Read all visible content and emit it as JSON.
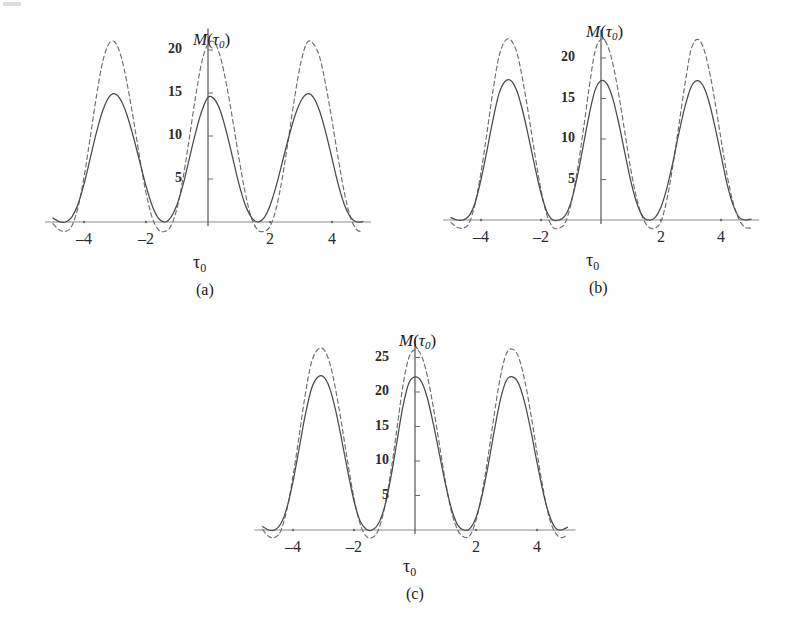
{
  "figure": {
    "panels": [
      {
        "id": "a",
        "caption": "(a)",
        "ylabel_main": "M",
        "ylabel_paren_open": "(",
        "ylabel_tau": "τ",
        "ylabel_sub": "0",
        "ylabel_paren_close": ")",
        "xlabel_tau": "τ",
        "xlabel_sub": "0",
        "yticks": [
          5,
          10,
          15,
          20
        ],
        "ytick_labels": [
          "5",
          "10",
          "15",
          "20"
        ],
        "xticks": [
          -4,
          -2,
          2,
          4
        ],
        "xtick_labels": [
          "–4",
          "–2",
          "2",
          "4"
        ]
      },
      {
        "id": "b",
        "caption": "(b)",
        "ylabel_main": "M",
        "ylabel_paren_open": "(",
        "ylabel_tau": "τ",
        "ylabel_sub": "0",
        "ylabel_paren_close": ")",
        "xlabel_tau": "τ",
        "xlabel_sub": "0",
        "yticks": [
          5,
          10,
          15,
          20
        ],
        "ytick_labels": [
          "5",
          "10",
          "15",
          "20"
        ],
        "xticks": [
          -4,
          -2,
          2,
          4
        ],
        "xtick_labels": [
          "–4",
          "–2",
          "2",
          "4"
        ]
      },
      {
        "id": "c",
        "caption": "(c)",
        "ylabel_main": "M",
        "ylabel_paren_open": "(",
        "ylabel_tau": "τ",
        "ylabel_sub": "0",
        "ylabel_paren_close": ")",
        "xlabel_tau": "τ",
        "xlabel_sub": "0",
        "yticks": [
          5,
          10,
          15,
          20,
          25
        ],
        "ytick_labels": [
          "5",
          "10",
          "15",
          "20",
          "25"
        ],
        "xticks": [
          -4,
          -2,
          2,
          4
        ],
        "xtick_labels": [
          "–4",
          "–2",
          "2",
          "4"
        ]
      }
    ]
  },
  "colors": {
    "curve_solid": "#4a4a4a",
    "curve_dashed": "#6e6e6e",
    "axis": "#8a8a8a",
    "text": "#2b2b2b",
    "background": "#ffffff"
  },
  "chart_data": [
    {
      "type": "line",
      "panel": "a",
      "title": "",
      "xlabel": "τ₀",
      "ylabel": "M(τ₀)",
      "xlim": [
        -5.0,
        5.0
      ],
      "ylim": [
        -1.6,
        22.5
      ],
      "xticks": [
        -4,
        -2,
        2,
        4
      ],
      "yticks": [
        5,
        10,
        15,
        20
      ],
      "grid": false,
      "legend": "none",
      "period": 3.1416,
      "series": [
        {
          "name": "solid",
          "style": "solid",
          "peak_value": 15.0,
          "peak_x_positions": [
            -3.15,
            0.0,
            3.15
          ],
          "minimum_value": -0.35,
          "minimum_x_positions": [
            -4.72,
            -1.57,
            1.57,
            4.72
          ],
          "x": [
            -5.0,
            -4.8,
            -4.6,
            -4.4,
            -4.2,
            -4.0,
            -3.8,
            -3.6,
            -3.4,
            -3.2,
            -3.0,
            -2.8,
            -2.6,
            -2.4,
            -2.2,
            -2.0,
            -1.8,
            -1.6,
            -1.4,
            -1.2,
            -1.0,
            -0.8,
            -0.6,
            -0.4,
            -0.2,
            0.0,
            0.2,
            0.4,
            0.6,
            0.8,
            1.0,
            1.2,
            1.4,
            1.6,
            1.8,
            2.0,
            2.2,
            2.4,
            2.6,
            2.8,
            3.0,
            3.2,
            3.4,
            3.6,
            3.8,
            4.0,
            4.2,
            4.4,
            4.6,
            4.8,
            5.0
          ],
          "y": [
            0.45,
            0.05,
            0.0,
            0.55,
            2.0,
            4.4,
            7.4,
            10.4,
            12.9,
            14.5,
            14.9,
            14.1,
            12.3,
            9.8,
            7.0,
            4.2,
            1.9,
            0.45,
            0.0,
            0.55,
            2.0,
            4.4,
            7.4,
            10.4,
            12.9,
            14.5,
            14.3,
            12.9,
            10.4,
            7.4,
            4.4,
            2.0,
            0.55,
            0.0,
            0.45,
            1.9,
            4.2,
            7.0,
            9.8,
            12.3,
            14.1,
            14.9,
            14.5,
            12.9,
            10.4,
            7.4,
            4.4,
            2.0,
            0.55,
            0.0,
            0.05
          ]
        },
        {
          "name": "dashed",
          "style": "dashed",
          "peak_value": 21.0,
          "peak_x_positions": [
            -3.15,
            0.1,
            3.15
          ],
          "minimum_value": -1.1,
          "minimum_x_positions": [
            -4.72,
            -1.57,
            1.57,
            4.72
          ],
          "x": [
            -5.0,
            -4.8,
            -4.6,
            -4.4,
            -4.2,
            -4.0,
            -3.8,
            -3.6,
            -3.4,
            -3.2,
            -3.0,
            -2.8,
            -2.6,
            -2.4,
            -2.2,
            -2.0,
            -1.8,
            -1.6,
            -1.4,
            -1.2,
            -1.0,
            -0.8,
            -0.6,
            -0.4,
            -0.2,
            0.0,
            0.2,
            0.4,
            0.6,
            0.8,
            1.0,
            1.2,
            1.4,
            1.6,
            1.8,
            2.0,
            2.2,
            2.4,
            2.6,
            2.8,
            3.0,
            3.2,
            3.4,
            3.6,
            3.8,
            4.0,
            4.2,
            4.4,
            4.6,
            4.8,
            5.0
          ],
          "y": [
            -0.2,
            -0.9,
            -1.1,
            -0.5,
            1.6,
            5.2,
            9.8,
            14.6,
            18.6,
            20.7,
            20.9,
            19.2,
            15.9,
            11.8,
            7.4,
            3.4,
            0.5,
            -0.9,
            -1.1,
            -0.5,
            1.6,
            5.2,
            9.8,
            14.6,
            18.6,
            20.7,
            20.9,
            19.2,
            15.9,
            11.8,
            7.4,
            3.4,
            0.5,
            -0.9,
            -1.1,
            -0.5,
            1.6,
            5.2,
            9.8,
            14.6,
            18.6,
            20.9,
            20.7,
            19.2,
            15.9,
            11.8,
            7.4,
            3.4,
            0.5,
            -0.9,
            -1.1
          ]
        }
      ]
    },
    {
      "type": "line",
      "panel": "b",
      "title": "",
      "xlabel": "τ₀",
      "ylabel": "M(τ₀)",
      "xlim": [
        -5.0,
        5.0
      ],
      "ylim": [
        -1.6,
        23.5
      ],
      "xticks": [
        -4,
        -2,
        2,
        4
      ],
      "yticks": [
        5,
        10,
        15,
        20
      ],
      "grid": false,
      "legend": "none",
      "period": 3.1416,
      "series": [
        {
          "name": "solid",
          "style": "solid",
          "peak_value": 17.2,
          "peak_x_positions": [
            -3.1,
            0.0,
            3.15
          ],
          "minimum_value": -0.2,
          "minimum_x_positions": [
            -4.72,
            -1.6,
            1.6,
            4.72
          ],
          "x": [
            -5.0,
            -4.8,
            -4.6,
            -4.4,
            -4.2,
            -4.0,
            -3.8,
            -3.6,
            -3.4,
            -3.2,
            -3.0,
            -2.8,
            -2.6,
            -2.4,
            -2.2,
            -2.0,
            -1.8,
            -1.6,
            -1.4,
            -1.2,
            -1.0,
            -0.8,
            -0.6,
            -0.4,
            -0.2,
            0.0,
            0.2,
            0.4,
            0.6,
            0.8,
            1.0,
            1.2,
            1.4,
            1.6,
            1.8,
            2.0,
            2.2,
            2.4,
            2.6,
            2.8,
            3.0,
            3.2,
            3.4,
            3.6,
            3.8,
            4.0,
            4.2,
            4.4,
            4.6,
            4.8,
            5.0
          ],
          "y": [
            0.3,
            0.0,
            0.0,
            0.5,
            2.1,
            5.0,
            8.6,
            12.4,
            15.6,
            17.1,
            17.2,
            15.9,
            13.3,
            10.0,
            6.5,
            3.3,
            1.0,
            0.0,
            0.0,
            0.5,
            2.2,
            5.2,
            9.0,
            12.9,
            16.0,
            17.2,
            16.8,
            14.9,
            11.8,
            8.2,
            4.7,
            2.0,
            0.4,
            0.0,
            0.3,
            1.6,
            4.0,
            7.2,
            10.8,
            14.0,
            16.4,
            17.2,
            16.6,
            14.6,
            11.5,
            8.0,
            4.5,
            1.9,
            0.35,
            0.0,
            0.1
          ]
        },
        {
          "name": "dashed",
          "style": "dashed",
          "peak_value": 22.3,
          "peak_x_positions": [
            -3.1,
            0.15,
            3.1
          ],
          "minimum_value": -1.0,
          "minimum_x_positions": [
            -4.72,
            -1.6,
            1.6,
            4.72
          ],
          "x": [
            -5.0,
            -4.8,
            -4.6,
            -4.4,
            -4.2,
            -4.0,
            -3.8,
            -3.6,
            -3.4,
            -3.2,
            -3.0,
            -2.8,
            -2.6,
            -2.4,
            -2.2,
            -2.0,
            -1.8,
            -1.6,
            -1.4,
            -1.2,
            -1.0,
            -0.8,
            -0.6,
            -0.4,
            -0.2,
            0.0,
            0.2,
            0.4,
            0.6,
            0.8,
            1.0,
            1.2,
            1.4,
            1.6,
            1.8,
            2.0,
            2.2,
            2.4,
            2.6,
            2.8,
            3.0,
            3.2,
            3.4,
            3.6,
            3.8,
            4.0,
            4.2,
            4.4,
            4.6,
            4.8,
            5.0
          ],
          "y": [
            -0.3,
            -0.9,
            -1.0,
            -0.4,
            2.0,
            5.9,
            10.8,
            16.0,
            20.2,
            22.1,
            22.2,
            20.6,
            17.1,
            12.7,
            8.0,
            3.7,
            0.6,
            -0.9,
            -1.0,
            -0.4,
            2.0,
            5.9,
            10.8,
            16.2,
            20.8,
            22.3,
            21.7,
            19.2,
            15.3,
            10.7,
            6.1,
            2.5,
            0.2,
            -0.9,
            -1.0,
            -0.2,
            2.6,
            6.8,
            11.8,
            16.8,
            21.0,
            22.3,
            21.4,
            18.6,
            14.6,
            10.0,
            5.6,
            2.2,
            0.1,
            -0.9,
            -1.0
          ]
        }
      ]
    },
    {
      "type": "line",
      "panel": "c",
      "title": "",
      "xlabel": "τ₀",
      "ylabel": "M(τ₀)",
      "xlim": [
        -5.0,
        5.0
      ],
      "ylim": [
        -1.6,
        27.5
      ],
      "xticks": [
        -4,
        -2,
        2,
        4
      ],
      "yticks": [
        5,
        10,
        15,
        20,
        25
      ],
      "grid": false,
      "legend": "none",
      "period": 3.1416,
      "series": [
        {
          "name": "solid",
          "style": "solid",
          "peak_value": 22.2,
          "peak_x_positions": [
            -2.95,
            0.05,
            3.3
          ],
          "minimum_value": -0.25,
          "minimum_x_positions": [
            -4.7,
            -1.75,
            1.7,
            4.75
          ],
          "x": [
            -5.0,
            -4.8,
            -4.6,
            -4.4,
            -4.2,
            -4.0,
            -3.8,
            -3.6,
            -3.4,
            -3.2,
            -3.0,
            -2.8,
            -2.6,
            -2.4,
            -2.2,
            -2.0,
            -1.8,
            -1.6,
            -1.4,
            -1.2,
            -1.0,
            -0.8,
            -0.6,
            -0.4,
            -0.2,
            0.0,
            0.2,
            0.4,
            0.6,
            0.8,
            1.0,
            1.2,
            1.4,
            1.6,
            1.8,
            2.0,
            2.2,
            2.4,
            2.6,
            2.8,
            3.0,
            3.2,
            3.4,
            3.6,
            3.8,
            4.0,
            4.2,
            4.4,
            4.6,
            4.8,
            5.0
          ],
          "y": [
            0.5,
            0.0,
            0.0,
            0.9,
            3.2,
            7.0,
            11.8,
            16.6,
            20.4,
            22.1,
            22.2,
            20.6,
            17.3,
            13.0,
            8.4,
            4.2,
            1.3,
            0.1,
            0.0,
            0.9,
            3.3,
            7.4,
            12.6,
            17.8,
            21.3,
            22.2,
            21.6,
            19.2,
            15.4,
            11.0,
            6.6,
            3.0,
            0.7,
            0.0,
            0.2,
            1.8,
            5.0,
            9.4,
            14.4,
            18.9,
            21.7,
            22.2,
            21.2,
            18.4,
            14.4,
            9.8,
            5.5,
            2.2,
            0.3,
            0.0,
            0.4
          ]
        },
        {
          "name": "dashed",
          "style": "dashed",
          "peak_value": 26.2,
          "peak_x_positions": [
            -2.95,
            0.1,
            3.3
          ],
          "minimum_value": -1.1,
          "minimum_x_positions": [
            -4.7,
            -1.75,
            1.7,
            4.75
          ],
          "x": [
            -5.0,
            -4.8,
            -4.6,
            -4.4,
            -4.2,
            -4.0,
            -3.8,
            -3.6,
            -3.4,
            -3.2,
            -3.0,
            -2.8,
            -2.6,
            -2.4,
            -2.2,
            -2.0,
            -1.8,
            -1.6,
            -1.4,
            -1.2,
            -1.0,
            -0.8,
            -0.6,
            -0.4,
            -0.2,
            0.0,
            0.2,
            0.4,
            0.6,
            0.8,
            1.0,
            1.2,
            1.4,
            1.6,
            1.8,
            2.0,
            2.2,
            2.4,
            2.6,
            2.8,
            3.0,
            3.2,
            3.4,
            3.6,
            3.8,
            4.0,
            4.2,
            4.4,
            4.6,
            4.8,
            5.0
          ],
          "y": [
            0.1,
            -0.9,
            -1.1,
            -0.1,
            3.0,
            7.8,
            13.6,
            19.6,
            24.2,
            26.1,
            26.2,
            24.3,
            20.3,
            15.2,
            9.7,
            4.6,
            0.9,
            -0.9,
            -1.1,
            0.0,
            3.2,
            8.2,
            14.4,
            20.8,
            25.0,
            26.1,
            25.4,
            22.4,
            17.8,
            12.4,
            7.0,
            2.6,
            0.0,
            -1.0,
            -0.8,
            1.4,
            5.4,
            10.8,
            16.8,
            22.2,
            25.6,
            26.2,
            25.0,
            21.6,
            16.8,
            11.2,
            6.0,
            1.8,
            -0.4,
            -1.1,
            -0.7
          ]
        }
      ]
    }
  ]
}
